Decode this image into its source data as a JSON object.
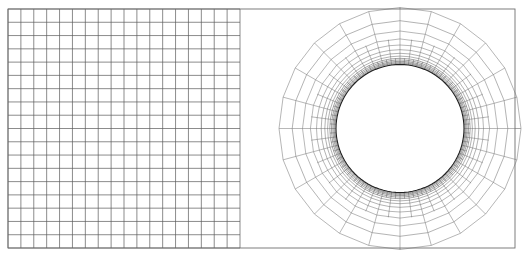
{
  "figure": {
    "canvas": {
      "width": 523,
      "height": 256,
      "background": "#ffffff"
    },
    "frame": {
      "name": "outer-domain-frame",
      "x": 8,
      "y": 9,
      "width": 507,
      "height": 239,
      "stroke": "#6f6f6f",
      "stroke_width": 0.9
    }
  },
  "colors": {
    "background": "#ffffff",
    "frame_stroke": "#6f6f6f",
    "grid_stroke": "#5a5a5a",
    "grid_stroke_light": "#9a9a9a",
    "mesh_stroke": "#7c7c7c",
    "mesh_stroke_fine": "#555555",
    "boundary_layer_stroke": "#2f2f2f",
    "circle_stroke": "#1f1f1f"
  },
  "cartesian_block": {
    "name": "structured-cartesian-grid",
    "x": 8,
    "y": 9,
    "width": 232,
    "height": 239,
    "columns": 18,
    "rows": 18,
    "cell_width": 12.9,
    "cell_height": 13.28,
    "stroke": "#5a5a5a",
    "stroke_width": 0.7
  },
  "transition_block": {
    "name": "transition-gap-region",
    "x": 240,
    "y": 9,
    "width": 275,
    "height": 239,
    "description": "Unmeshed/blank buffer between Cartesian block and O-grid outer boundary"
  },
  "ogrid": {
    "name": "o-grid-around-circle",
    "center_x": 400,
    "center_y": 128.5,
    "inner_radius": 64,
    "angular_sectors": 24,
    "sector_angle_deg": 15,
    "radial_rings": [
      {
        "index": 0,
        "radius": 64.0,
        "kind": "cylinder-wall",
        "stroke": "#1f1f1f",
        "stroke_width": 1.1,
        "angular_divisions": 96
      },
      {
        "index": 1,
        "radius": 64.9,
        "kind": "boundary-layer",
        "stroke": "#2f2f2f",
        "stroke_width": 0.45,
        "angular_divisions": 96
      },
      {
        "index": 2,
        "radius": 65.9,
        "kind": "boundary-layer",
        "stroke": "#2f2f2f",
        "stroke_width": 0.45,
        "angular_divisions": 96
      },
      {
        "index": 3,
        "radius": 67.1,
        "kind": "boundary-layer",
        "stroke": "#2f2f2f",
        "stroke_width": 0.45,
        "angular_divisions": 96
      },
      {
        "index": 4,
        "radius": 68.5,
        "kind": "boundary-layer",
        "stroke": "#3a3a3a",
        "stroke_width": 0.45,
        "angular_divisions": 96
      },
      {
        "index": 5,
        "radius": 70.2,
        "kind": "boundary-layer",
        "stroke": "#3a3a3a",
        "stroke_width": 0.45,
        "angular_divisions": 48
      },
      {
        "index": 6,
        "radius": 72.4,
        "kind": "near-wall",
        "stroke": "#555555",
        "stroke_width": 0.45,
        "angular_divisions": 48
      },
      {
        "index": 7,
        "radius": 75.2,
        "kind": "near-wall",
        "stroke": "#555555",
        "stroke_width": 0.45,
        "angular_divisions": 48
      },
      {
        "index": 8,
        "radius": 78.8,
        "kind": "near-wall",
        "stroke": "#666666",
        "stroke_width": 0.5,
        "angular_divisions": 48
      },
      {
        "index": 9,
        "radius": 83.5,
        "kind": "mid-field",
        "stroke": "#6f6f6f",
        "stroke_width": 0.5,
        "angular_divisions": 48
      },
      {
        "index": 10,
        "radius": 89.6,
        "kind": "mid-field",
        "stroke": "#7c7c7c",
        "stroke_width": 0.55,
        "angular_divisions": 24
      },
      {
        "index": 11,
        "radius": 97.5,
        "kind": "mid-field",
        "stroke": "#7c7c7c",
        "stroke_width": 0.55,
        "angular_divisions": 24
      },
      {
        "index": 12,
        "radius": 107.8,
        "kind": "far-field",
        "stroke": "#808080",
        "stroke_width": 0.6,
        "angular_divisions": 24
      },
      {
        "index": 13,
        "radius": 121.0,
        "kind": "far-field-outer",
        "stroke": "#858585",
        "stroke_width": 0.6,
        "angular_divisions": 24
      }
    ],
    "radial_spoke_groups": [
      {
        "name": "fine-spokes",
        "count": 96,
        "r_from": 64.0,
        "r_to": 70.2,
        "stroke": "#2f2f2f",
        "stroke_width": 0.35
      },
      {
        "name": "medium-spokes",
        "count": 48,
        "r_from": 70.2,
        "r_to": 89.6,
        "stroke": "#606060",
        "stroke_width": 0.45
      },
      {
        "name": "coarse-spokes",
        "count": 24,
        "r_from": 89.6,
        "r_to": 121.0,
        "stroke": "#7c7c7c",
        "stroke_width": 0.55
      }
    ],
    "axis_marks": {
      "name": "center-axis-crosshairs",
      "stroke": "#9a9a9a",
      "stroke_width": 0.6,
      "vertical_top": {
        "x": 400,
        "y1": 9,
        "y2": 7.5
      },
      "vertical_bottom": {
        "x": 400,
        "y1": 248,
        "y2": 249.5
      },
      "horizontal_right": {
        "y": 128.5,
        "x1": 515,
        "x2": 521
      }
    }
  }
}
